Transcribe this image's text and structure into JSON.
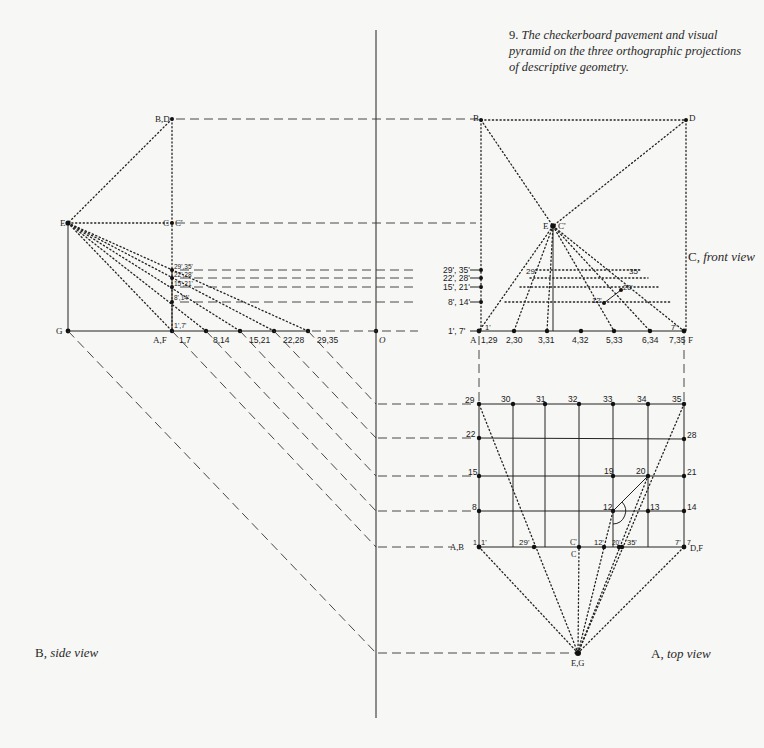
{
  "caption": {
    "number": "9.",
    "text": "The checkerboard pavement and visual pyramid on the three orthographic projections of descriptive geometry."
  },
  "view_labels": {
    "side": {
      "letter": "B,",
      "name": "side view"
    },
    "top": {
      "letter": "A,",
      "name": "top view"
    },
    "front": {
      "letter": "C,",
      "name": "front view"
    }
  },
  "side_view": {
    "points": {
      "BD": "B,D",
      "E": "E",
      "C": "C",
      "C_prime": "C'",
      "G": "G",
      "AF": "A,F",
      "O": "O"
    },
    "baseline_labels": [
      "1,7",
      "8,14",
      "15,21",
      "22,28",
      "29,35"
    ],
    "elevation_labels": [
      "1',7'",
      "8',14'",
      "15',21'",
      "22',28'",
      "29',35'"
    ]
  },
  "front_view": {
    "points": {
      "A": "A",
      "F": "F",
      "B": "B",
      "D": "D",
      "E": "E",
      "C_prime": "C'"
    },
    "baseline_labels": [
      "1,29",
      "2,30",
      "3,31",
      "4,32",
      "5,33",
      "6,34",
      "7,35"
    ],
    "left_edge_labels": [
      "1', 7'",
      "8', 14'",
      "15', 21'",
      "22', 28'",
      "29', 35'"
    ],
    "inner_labels": {
      "l1": "1'",
      "l7": "7'",
      "l29": "29'",
      "l35": "35'",
      "l12": "12'",
      "l20": "20'"
    }
  },
  "top_view": {
    "top_row": [
      "29",
      "30",
      "31",
      "32",
      "33",
      "34",
      "35"
    ],
    "left_col": [
      "22",
      "15",
      "8"
    ],
    "right_col": [
      "28",
      "21",
      "14"
    ],
    "inner": {
      "n19": "19",
      "n20": "20",
      "n12": "12",
      "n13": "13"
    },
    "bottom_row": {
      "n1": "1",
      "n1p": "1'",
      "AB": "A,B",
      "n29p": "29'",
      "C_prime": "C'",
      "C": "C",
      "n12p": "12'",
      "n20p": "20'",
      "n35p": "35'",
      "n7p": "7'",
      "n7": "7",
      "DF": "D,F"
    },
    "eye": "E,G"
  }
}
